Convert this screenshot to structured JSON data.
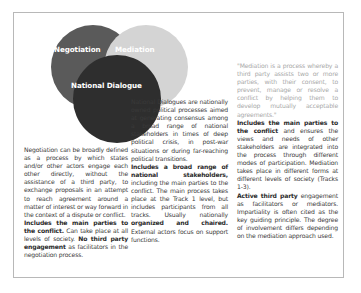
{
  "diagram": {
    "circles": [
      {
        "id": "negotiation",
        "label": "Negotiation",
        "color": "#5a5a5a"
      },
      {
        "id": "mediation",
        "label": "Mediation",
        "color": "#d4d4d4"
      },
      {
        "id": "national_dialogue",
        "label": "National Dialogue",
        "color": "#2e2e2e"
      }
    ]
  },
  "columns": {
    "negotiation": {
      "definition": "Negotiation can be broadly defined as a process by which states and/or other actors engage each other directly, without the assistance of a third party, to exchange proposals in an attempt to reach agreement around a matter of interest or way forward in the context of a dispute or conflict.",
      "features_bold_1": "Includes the main parties to the conflict.",
      "features_plain_1": " Can take place at all levels of society. ",
      "features_bold_2": "No third party engagement",
      "features_plain_2": " as facilitators in the negotiation process."
    },
    "national_dialogue": {
      "definition": "National Dialogues are nationally owned political processes aimed at generating consensus among a broad range of national stakeholders in times of deep political crisis, in post-war situations or during far-reaching political transitions.",
      "features_bold_1": "Includes a broad range of national stakeholders,",
      "features_plain_1": " including the main parties to the conflict. The main process takes place at the Track 1 level, but includes participants from all tracks. Usually nationally ",
      "features_bold_2": "organized and chaired.",
      "features_plain_2": " External actors focus on support functions."
    },
    "mediation": {
      "quote": "\"Mediation is a process whereby a third party assists two or more parties, with their consent, to prevent, manage or resolve a conflict by helping them to develop mutually acceptable agreements.\"",
      "features_bold_1": "Includes the main parties to the conflict",
      "features_plain_1": " and ensures the views and needs of other stakeholders are integrated into the process through different modes of participation. Mediation takes place in different forms at different levels of society (Tracks 1-3).",
      "features_bold_2": "Active third party",
      "features_plain_2": " engagement as facilitators or mediators. Impartiality is often cited as the key guiding principle. The degree of involvement differs depending on the mediation approach used."
    }
  }
}
